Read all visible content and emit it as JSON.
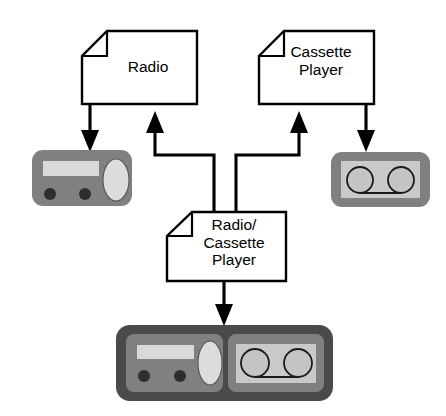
{
  "diagram": {
    "background_color": "#ffffff",
    "line_color": "#000000",
    "notes": [
      {
        "id": "radio-note",
        "label": "Radio",
        "lines": [
          "Radio"
        ]
      },
      {
        "id": "cassette-player-note",
        "label": "Cassette Player",
        "lines": [
          "Cassette",
          "Player"
        ]
      },
      {
        "id": "radio-cassette-player-note",
        "label": "Radio/Cassette Player",
        "lines": [
          "Radio/",
          "Cassette",
          "Player"
        ]
      }
    ],
    "devices": [
      {
        "id": "radio-device",
        "name": "radio illustration",
        "body_color": "#808080",
        "display_color": "#d9d9d9",
        "knob_color": "#2e2e2e",
        "speaker_color": "#dcdcdc",
        "knob_count": 2
      },
      {
        "id": "cassette-device",
        "name": "cassette illustration",
        "shell_color": "#808080",
        "panel_color": "#c9c9c9",
        "reel_color": "#c4c4c4",
        "reel_count": 2
      },
      {
        "id": "radio-cassette-device",
        "name": "radio cassette player illustration",
        "shell_color": "#4a4a4a",
        "body_color": "#808080",
        "panel_color": "#c9c9c9",
        "display_color": "#d9d9d9",
        "knob_count": 2,
        "reel_count": 2
      }
    ],
    "connectors": [
      {
        "id": "radio-to-radio-device",
        "from": "radio-note",
        "to": "radio-device",
        "direction": "down",
        "style": "solid-arrow"
      },
      {
        "id": "cassette-note-to-cassette-device",
        "from": "cassette-player-note",
        "to": "cassette-device",
        "direction": "down",
        "style": "solid-arrow"
      },
      {
        "id": "combined-to-radio-note",
        "from": "radio-cassette-player-note",
        "to": "radio-note",
        "direction": "up",
        "style": "solid-arrow"
      },
      {
        "id": "combined-to-cassette-note",
        "from": "radio-cassette-player-note",
        "to": "cassette-player-note",
        "direction": "up",
        "style": "solid-arrow"
      },
      {
        "id": "combined-to-combined-device",
        "from": "radio-cassette-player-note",
        "to": "radio-cassette-device",
        "direction": "down",
        "style": "solid-arrow"
      }
    ]
  }
}
